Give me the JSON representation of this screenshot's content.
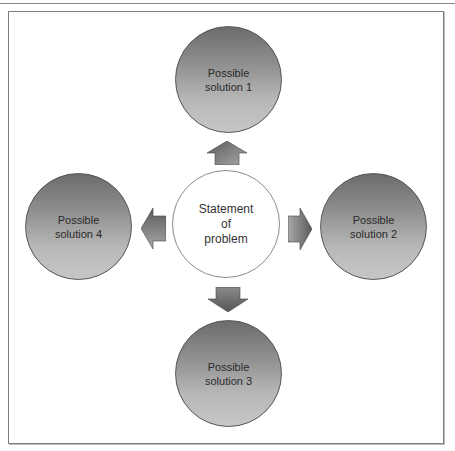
{
  "diagram": {
    "center": {
      "label": "Statement\nof\nproblem"
    },
    "solutions": [
      {
        "label": "Possible\nsolution 1",
        "position": "top"
      },
      {
        "label": "Possible\nsolution 2",
        "position": "right"
      },
      {
        "label": "Possible\nsolution 3",
        "position": "bottom"
      },
      {
        "label": "Possible\nsolution 4",
        "position": "left"
      }
    ],
    "arrows": [
      {
        "direction": "up"
      },
      {
        "direction": "right"
      },
      {
        "direction": "down"
      },
      {
        "direction": "left"
      }
    ],
    "colors": {
      "solution_gradient_top": "#6c6c6c",
      "solution_gradient_bottom": "#c6c6c6",
      "center_fill": "#ffffff",
      "arrow_dark": "#555555",
      "arrow_light": "#a8a8a8",
      "frame_border": "#7d7d7d"
    }
  }
}
